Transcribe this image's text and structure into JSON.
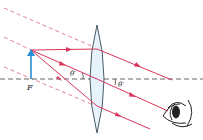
{
  "diagram": {
    "labels": {
      "focal_point": "F",
      "angle_left": "θ′",
      "angle_right": "θ′"
    },
    "colors": {
      "ray": "#d9345a",
      "dashed_ray": "#e0708a",
      "axis": "#555555",
      "object_arrow": "#2a8fd6",
      "lens_fill": "#e6f3fa",
      "lens_stroke": "#3a4a55",
      "eye": "#222222"
    },
    "elements": {
      "optical_axis": "horizontal dashed principal axis",
      "lens": "converging (biconvex) lens",
      "object": "upright object arrow at focal point F",
      "eye": "observer eye on right"
    }
  }
}
